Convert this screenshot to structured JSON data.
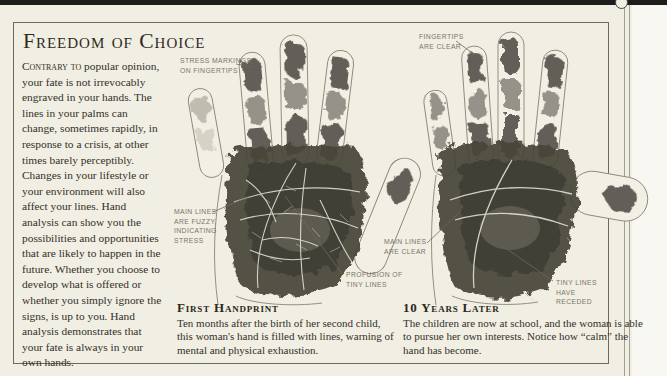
{
  "page": {
    "title": "Freedom of Choice",
    "intro": {
      "lead": "Contrary to",
      "rest": " popular opinion, your fate is not irrevocably engraved in your hands. The lines in your palms can change, sometimes rapidly, in response to a crisis, at other times barely perceptibly. Changes in your lifestyle or your environment will also affect your lines. Hand analysis can show you the possibilities and opportunities that are likely to happen in the future. Whether you choose to develop what is offered or whether you simply ignore the signs, is up to you. Hand analysis demonstrates that your fate is always in your own hands."
    },
    "colors": {
      "paper": "#f1eee3",
      "ink": "#2f2b22",
      "annotation": "#7b7668",
      "print_ink": "#474439"
    }
  },
  "annotations": {
    "stress_markings": "STRESS MARKINGS\nON FINGERTIPS",
    "main_lines_fuzzy": "MAIN LINES\nARE FUZZY,\nINDICATING\nSTRESS",
    "profusion": "PROFUSION OF\nTINY LINES",
    "fingertips_clear": "FINGERTIPS\nARE CLEAR",
    "main_lines_clear": "MAIN LINES\nARE CLEAR",
    "tiny_lines_receded": "TINY LINES\nHAVE\nRECEDED"
  },
  "captions": {
    "first": {
      "title": "First Handprint",
      "body": "Ten months after the birth of her second child, this woman's hand is filled with lines, warning of mental and physical exhaustion."
    },
    "later": {
      "title": "10 Years Later",
      "body": "The children are now at school, and the woman is able to pursue her own interests. Notice how “calm” the hand has become."
    }
  }
}
